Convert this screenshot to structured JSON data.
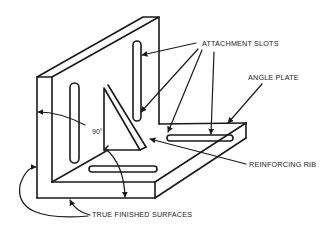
{
  "diagram": {
    "labels": {
      "attachment_slots": "ATTACHMENT SLOTS",
      "angle_plate": "ANGLE PLATE",
      "reinforcing_rib": "REINFORCING RIB",
      "true_finished_surfaces": "TRUE FINISHED SURFACES",
      "angle": "90°"
    },
    "parts": [
      {
        "name": "vertical-plate",
        "description": "Upright plate with two vertical attachment slots"
      },
      {
        "name": "base-plate",
        "description": "Horizontal base plate with two horizontal attachment slots"
      },
      {
        "name": "reinforcing-rib",
        "description": "Triangular rib joining vertical and base plates at 90 degrees"
      }
    ],
    "callouts": [
      {
        "label_ref": "attachment_slots",
        "leader_count": 4
      },
      {
        "label_ref": "angle_plate",
        "leader_count": 1
      },
      {
        "label_ref": "reinforcing_rib",
        "leader_count": 1
      },
      {
        "label_ref": "true_finished_surfaces",
        "leader_count": 2
      }
    ]
  }
}
